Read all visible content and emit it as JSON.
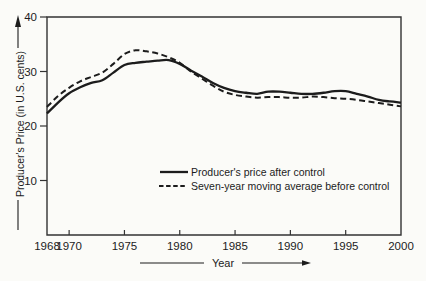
{
  "figure": {
    "background": "#fbfbf8",
    "ink": "#1c1c1c",
    "frame_color": "#333333"
  },
  "icons": {
    "y_axis_arrow": "up-arrow",
    "x_axis_arrow": "right-arrow"
  },
  "chart_data": {
    "type": "line",
    "title": "",
    "xlabel": "Year",
    "ylabel": "Producer's Price (in U.S. cents)",
    "xlim": [
      1968,
      2000
    ],
    "ylim": [
      0,
      40
    ],
    "x_ticks": [
      1968,
      1970,
      1975,
      1980,
      1985,
      1990,
      1995,
      2000
    ],
    "y_ticks": [
      40,
      30,
      20,
      10
    ],
    "grid": false,
    "legend_position": "inside-bottom-center",
    "x": [
      1968,
      1969,
      1970,
      1971,
      1972,
      1973,
      1974,
      1975,
      1976,
      1977,
      1978,
      1979,
      1980,
      1981,
      1982,
      1983,
      1984,
      1985,
      1986,
      1987,
      1988,
      1989,
      1990,
      1991,
      1992,
      1993,
      1994,
      1995,
      1996,
      1997,
      1998,
      1999,
      2000
    ],
    "series": [
      {
        "name": "Producer's price after control",
        "style": "solid",
        "values": [
          22.3,
          24.3,
          26.0,
          27.1,
          27.9,
          28.4,
          29.8,
          31.2,
          31.6,
          31.8,
          32.0,
          32.1,
          31.4,
          30.2,
          29.1,
          27.9,
          27.0,
          26.4,
          26.1,
          25.9,
          26.3,
          26.3,
          26.1,
          25.9,
          25.9,
          26.1,
          26.4,
          26.4,
          25.9,
          25.4,
          24.8,
          24.5,
          24.3
        ]
      },
      {
        "name": "Seven-year moving average before control",
        "style": "dashed",
        "values": [
          23.5,
          25.5,
          27.0,
          28.2,
          29.0,
          29.8,
          31.4,
          33.2,
          33.9,
          33.7,
          33.3,
          32.6,
          31.6,
          30.0,
          28.7,
          27.4,
          26.3,
          25.7,
          25.4,
          25.2,
          25.3,
          25.3,
          25.2,
          25.2,
          25.4,
          25.3,
          25.1,
          25.0,
          24.8,
          24.5,
          24.2,
          23.9,
          23.6
        ]
      }
    ]
  }
}
